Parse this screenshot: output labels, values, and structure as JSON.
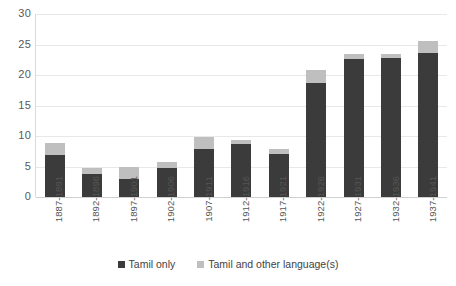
{
  "chart_data": {
    "type": "bar",
    "subtype": "stacked-vertical",
    "title": "",
    "xlabel": "",
    "ylabel": "",
    "ylim": [
      0,
      30
    ],
    "ytick_interval": 5,
    "ytick_labels": [
      "30",
      "25",
      "20",
      "15",
      "10",
      "5",
      "0"
    ],
    "grid": true,
    "legend_position": "bottom-center",
    "categories": [
      "1887-1891",
      "1892-1896",
      "1897-1901",
      "1902-1906",
      "1907-1911",
      "1912-1916",
      "1917-1921",
      "1922-1926",
      "1927-1931",
      "1932-1936",
      "1937-1941"
    ],
    "series": [
      {
        "name": "Tamil only",
        "color": "#3b3b3b",
        "values": [
          6.9,
          3.8,
          2.9,
          4.8,
          7.8,
          8.7,
          7.0,
          18.7,
          22.6,
          22.8,
          23.6
        ]
      },
      {
        "name": "Tamil and other language(s)",
        "color": "#bfbfbf",
        "values": [
          2.0,
          1.0,
          2.0,
          1.0,
          2.0,
          0.7,
          0.8,
          2.2,
          0.8,
          0.6,
          1.9
        ]
      }
    ],
    "totals": [
      8.9,
      4.8,
      4.9,
      5.8,
      9.8,
      9.4,
      7.8,
      20.9,
      23.4,
      23.4,
      25.5
    ]
  },
  "legend": {
    "items": [
      {
        "label": "Tamil only",
        "color": "#3b3b3b"
      },
      {
        "label": "Tamil and other language(s)",
        "color": "#bfbfbf"
      }
    ]
  }
}
